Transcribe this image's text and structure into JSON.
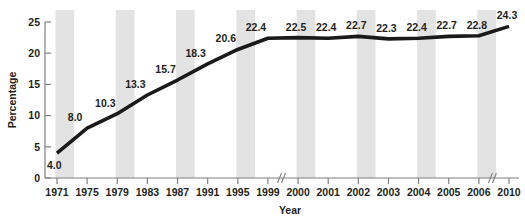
{
  "chart_data": {
    "type": "line",
    "title": "",
    "xlabel": "Year",
    "ylabel": "Percentage",
    "categories": [
      "1971",
      "1975",
      "1979",
      "1983",
      "1987",
      "1991",
      "1995",
      "1999",
      "2000",
      "2001",
      "2002",
      "2003",
      "2004",
      "2005",
      "2006",
      "2010"
    ],
    "values": [
      4.0,
      8.0,
      10.3,
      13.3,
      15.7,
      18.3,
      20.6,
      22.4,
      22.5,
      22.4,
      22.7,
      22.3,
      22.4,
      22.7,
      22.8,
      24.3
    ],
    "point_labels": [
      "4.0",
      "8.0",
      "10.3",
      "13.3",
      "15.7",
      "18.3",
      "20.6",
      "22.4",
      "22.5",
      "22.4",
      "22.7",
      "22.3",
      "22.4",
      "22.7",
      "22.8",
      "24.3"
    ],
    "ylim": [
      0,
      25
    ],
    "y_ticks": [
      0,
      5,
      10,
      15,
      20,
      25
    ],
    "y_tick_labels": [
      "0",
      "5",
      "10",
      "15",
      "20",
      "25"
    ],
    "grid": false,
    "legend": "none",
    "axis_breaks": [
      "between 1999 and 2000",
      "between 2006 and 2010"
    ],
    "banding": "alternating vertical gray bands behind every other category interval",
    "colors": {
      "line": "#1a1a1a",
      "band": "#e3e3e3",
      "axis": "#808080",
      "text": "#231f20",
      "background": "#ffffff"
    }
  },
  "axis": {
    "y_title": "Percentage",
    "x_title": "Year"
  }
}
